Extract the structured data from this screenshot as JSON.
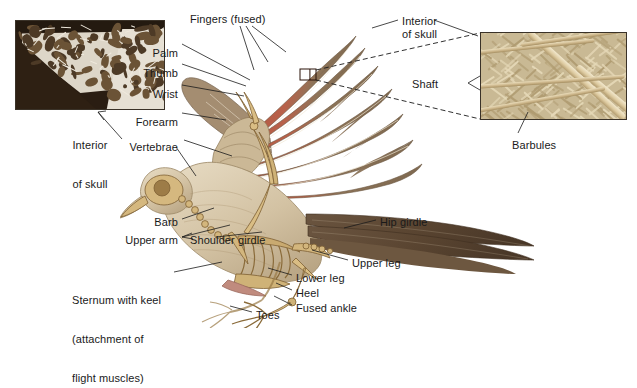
{
  "figure": {
    "background_color": "#ffffff",
    "label_color": "#1a1a1a",
    "leader_line_color": "#1a1a1a"
  },
  "insets": [
    {
      "id": "skull-inset",
      "name": "interior-of-skull-micrograph",
      "caption": "Interior\nof skull",
      "caption_line1": "Interior",
      "caption_line2": "of skull",
      "description": "cross-section micrograph of hollow bird skull bone showing air-filled struts",
      "x": 15,
      "y": 20,
      "width": 150,
      "height": 90,
      "border_color": "#3a3228"
    },
    {
      "id": "feather-inset",
      "name": "feather-barbule-micrograph",
      "description": "magnified feather vane showing shaft, barbs and interlocking barbules",
      "x": 480,
      "y": 32,
      "width": 147,
      "height": 88,
      "border_color": "#3a3228"
    }
  ],
  "callout_box": {
    "name": "feather-detail-callout",
    "x": 300,
    "y": 69,
    "width": 16,
    "height": 11,
    "color": "#2a1208"
  },
  "labels": [
    {
      "id": "fingers",
      "text": "Fingers (fused)",
      "x": 190,
      "y": 13,
      "align": "left"
    },
    {
      "id": "palm",
      "text": "Palm",
      "x": 178,
      "y": 47,
      "align": "right"
    },
    {
      "id": "thumb",
      "text": "Thumb",
      "x": 178,
      "y": 67,
      "align": "right"
    },
    {
      "id": "wrist",
      "text": "Wrist",
      "x": 178,
      "y": 88,
      "align": "right"
    },
    {
      "id": "forearm",
      "text": "Forearm",
      "x": 178,
      "y": 116,
      "align": "right"
    },
    {
      "id": "vertebrae",
      "text": "Vertebrae",
      "x": 178,
      "y": 141,
      "align": "right"
    },
    {
      "id": "interior-skull",
      "text": "Interior\nof skull",
      "x": 90,
      "y": 113,
      "align": "center"
    },
    {
      "id": "shaft",
      "text": "Shaft",
      "x": 402,
      "y": 15,
      "align": "left"
    },
    {
      "id": "barbules",
      "text": "Barbules",
      "x": 412,
      "y": 78,
      "align": "left"
    },
    {
      "id": "barb",
      "text": "Barb",
      "x": 512,
      "y": 139,
      "align": "left"
    },
    {
      "id": "upper-arm",
      "text": "Upper arm",
      "x": 178,
      "y": 216,
      "align": "right"
    },
    {
      "id": "shoulder-girdle",
      "text": "Shoulder girdle",
      "x": 178,
      "y": 234,
      "align": "right"
    },
    {
      "id": "ribs",
      "text": "Ribs",
      "x": 190,
      "y": 234,
      "align": "left"
    },
    {
      "id": "sternum",
      "text": "Sternum with keel\n(attachment of\nflight muscles)",
      "x": 72,
      "y": 268,
      "align": "left"
    },
    {
      "id": "hip-girdle",
      "text": "Hip girdle",
      "x": 380,
      "y": 216,
      "align": "left"
    },
    {
      "id": "upper-leg",
      "text": "Upper leg",
      "x": 352,
      "y": 257,
      "align": "left"
    },
    {
      "id": "lower-leg",
      "text": "Lower leg",
      "x": 296,
      "y": 272,
      "align": "left"
    },
    {
      "id": "heel",
      "text": "Heel",
      "x": 296,
      "y": 287,
      "align": "left"
    },
    {
      "id": "fused-ankle",
      "text": "Fused ankle",
      "x": 296,
      "y": 302,
      "align": "left"
    },
    {
      "id": "toes",
      "text": "Toes",
      "x": 256,
      "y": 309,
      "align": "left"
    }
  ],
  "sternum_lines": [
    "Sternum with keel",
    "(attachment of",
    "flight muscles)"
  ],
  "skull_caption_lines": [
    "Interior",
    "of skull"
  ],
  "bird": {
    "name": "bird-skeleton-illustration",
    "description": "Landing bird with wings raised, body rendered semi-transparent to reveal the skeleton",
    "plumage_colors": {
      "wing_rust": "#b35a42",
      "wing_brown": "#8a7257",
      "tail_dark": "#55412e",
      "body_tan": "#d8c9ac",
      "bone": "#c8a96f",
      "bone_shadow": "#8a6b3a",
      "keel_pink": "#c98f80"
    }
  }
}
